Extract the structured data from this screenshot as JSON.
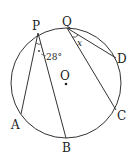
{
  "diagram": {
    "center_label": "O",
    "points": {
      "P": "P",
      "Q": "Q",
      "D": "D",
      "C": "C",
      "B": "B",
      "A": "A"
    },
    "angle_label": "28°",
    "unknown_label": "x",
    "chords": [
      "PA",
      "PB",
      "QC",
      "QD"
    ],
    "colors": {
      "stroke": "#333333",
      "text": "#222222"
    }
  }
}
